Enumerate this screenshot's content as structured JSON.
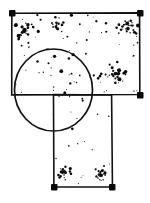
{
  "figure": {
    "kind": "line-drawing",
    "background_color": "#ffffff",
    "ink_color": "#111111",
    "canvas": {
      "width": 150,
      "height": 203
    },
    "shapes": [
      {
        "name": "top-rectangle",
        "type": "rect",
        "x": 12,
        "y": 13,
        "width": 128,
        "height": 82,
        "stroke_width": 1.6,
        "filled": false
      },
      {
        "name": "stem-rectangle",
        "type": "rect",
        "x": 54,
        "y": 95,
        "width": 58,
        "height": 92,
        "stroke_width": 1.6,
        "filled": false
      },
      {
        "name": "overlap-circle",
        "type": "circle",
        "cx": 53.5,
        "cy": 90,
        "r": 39.5,
        "stroke_width": 1.7,
        "filled": false
      }
    ],
    "corner_marks": [
      {
        "name": "top-rect-top-left",
        "x": 12,
        "y": 13
      },
      {
        "name": "top-rect-top-right",
        "x": 140,
        "y": 13
      },
      {
        "name": "top-rect-bottom-right",
        "x": 140,
        "y": 95
      },
      {
        "name": "stem-rect-bottom-left",
        "x": 54,
        "y": 187
      },
      {
        "name": "stem-rect-bottom-right",
        "x": 112,
        "y": 187
      }
    ],
    "speckle": {
      "description": "random stipple dots scattered inside the T outline",
      "count": 245,
      "dot_radius_min": 0.45,
      "dot_radius_max": 1.9,
      "clusters": [
        {
          "name": "top-left-cluster",
          "cx": 24,
          "cy": 30,
          "spread": 9,
          "count": 22
        },
        {
          "name": "top-center-cluster",
          "cx": 58,
          "cy": 24,
          "spread": 8,
          "count": 16
        },
        {
          "name": "top-right-cluster",
          "cx": 128,
          "cy": 27,
          "spread": 9,
          "count": 20
        },
        {
          "name": "mid-right-cluster",
          "cx": 120,
          "cy": 77,
          "spread": 9,
          "count": 24
        },
        {
          "name": "circle-lower-left-cluster",
          "cx": 30,
          "cy": 113,
          "spread": 9,
          "count": 22
        },
        {
          "name": "stem-bottom-left-cluster",
          "cx": 66,
          "cy": 172,
          "spread": 8,
          "count": 18
        },
        {
          "name": "stem-bottom-right-cluster",
          "cx": 101,
          "cy": 174,
          "spread": 8,
          "count": 18
        }
      ],
      "seed": 20250614
    }
  }
}
